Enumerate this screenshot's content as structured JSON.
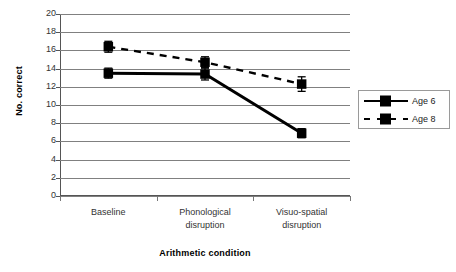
{
  "chart_data": {
    "type": "line",
    "title": "",
    "xlabel": "Arithmetic condition",
    "ylabel": "No. correct",
    "categories": [
      "Baseline",
      "Phonological disruption",
      "Visuo-spatial disruption"
    ],
    "category_lines": [
      [
        "Baseline"
      ],
      [
        "Phonological",
        "disruption"
      ],
      [
        "Visuo-spatial",
        "disruption"
      ]
    ],
    "ylim": [
      0,
      20
    ],
    "ytick_step": 2,
    "yticks": [
      "20",
      "18",
      "16",
      "14",
      "12",
      "10",
      "8",
      "6",
      "4",
      "2",
      "0"
    ],
    "ytick_values": [
      20,
      18,
      16,
      14,
      12,
      10,
      8,
      6,
      4,
      2,
      0
    ],
    "grid": true,
    "grid_color": "#808080",
    "legend_position": "right",
    "series": [
      {
        "name": "Age 6",
        "values": [
          13.5,
          13.4,
          6.9
        ],
        "errors": [
          0.55,
          0.65,
          0.5
        ],
        "line_style": "solid",
        "color": "#000000",
        "marker": "square"
      },
      {
        "name": "Age 8",
        "values": [
          16.4,
          14.7,
          12.3
        ],
        "errors": [
          0.6,
          0.6,
          0.8
        ],
        "line_style": "dashed",
        "color": "#000000",
        "marker": "square"
      }
    ]
  },
  "legend": {
    "entries": [
      {
        "label": "Age 6"
      },
      {
        "label": "Age 8"
      }
    ]
  }
}
